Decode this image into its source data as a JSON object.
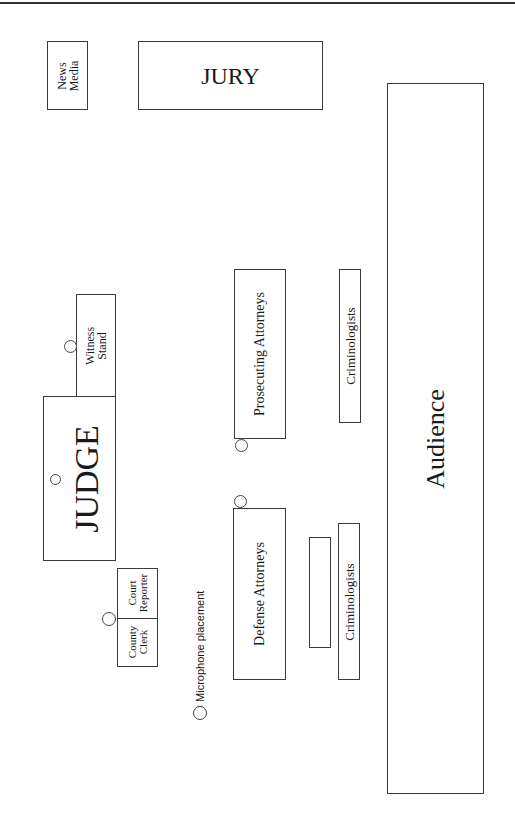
{
  "diagram": {
    "areas": {
      "news_media": {
        "line1": "News",
        "line2": "Media"
      },
      "jury": "JURY",
      "audience": "Audience",
      "witness_stand": {
        "line1": "Witness",
        "line2": "Stand"
      },
      "judge": "JUDGE",
      "court_reporter": {
        "line1": "Court",
        "line2": "Reporter"
      },
      "county_clerk": {
        "line1": "County",
        "line2": "Clerk"
      },
      "prosecuting_attorneys": "Prosecuting Attorneys",
      "defense_attorneys": "Defense Attorneys",
      "criminologists_upper": "Criminologists",
      "criminologists_lower": "Criminologists",
      "unlabeled_table": ""
    },
    "legend": {
      "symbol": "circle",
      "text": "= Microphone placement"
    },
    "microphones": [
      "witness-stand",
      "judge",
      "clerk-reporter",
      "prosecuting-attorneys",
      "defense-attorneys"
    ],
    "colors": {
      "line": "#3a3a3a",
      "background": "#ffffff"
    }
  }
}
